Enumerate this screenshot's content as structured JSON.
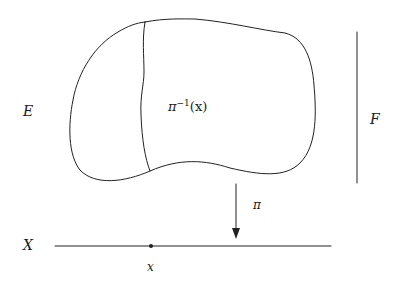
{
  "diagram": {
    "type": "fiber-bundle",
    "labels": {
      "total_space": "E",
      "fiber_space": "F",
      "base_space": "X",
      "base_point": "x",
      "projection": "π",
      "fiber_symbol": "π",
      "fiber_exponent": "−1",
      "fiber_argument": "(x)"
    },
    "colors": {
      "stroke": "#222222",
      "background": "#ffffff"
    }
  }
}
